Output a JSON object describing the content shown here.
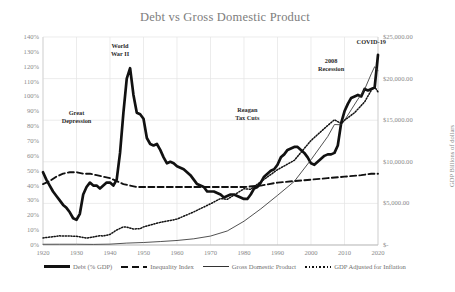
{
  "chart_data": {
    "type": "line",
    "title": "Debt vs Gross Domestic Product",
    "xlabel": "",
    "ylabel_left": "",
    "ylabel_right": "GDP Billions of dollars",
    "grid": true,
    "legend_position": "bottom",
    "xlim": [
      1920,
      2020
    ],
    "xticks": [
      "1920",
      "1930",
      "1940",
      "1950",
      "1960",
      "1970",
      "1980",
      "1990",
      "2000",
      "2010",
      "2020"
    ],
    "ylim_left": [
      0,
      140
    ],
    "yticks_left": [
      "0%",
      "10%",
      "20%",
      "30%",
      "40%",
      "50%",
      "60%",
      "70%",
      "80%",
      "90%",
      "100%",
      "110%",
      "120%",
      "130%",
      "140%"
    ],
    "ylim_right": [
      0,
      25000
    ],
    "yticks_right": [
      "$-",
      "$5,000.00",
      "$10,000.00",
      "$15,000.00",
      "$20,000.00",
      "$25,000.00"
    ],
    "annotations": [
      {
        "text": "Great Depression",
        "lines": [
          "Great",
          "Depression"
        ],
        "x": 1930,
        "y": 88
      },
      {
        "text": "World War II",
        "lines": [
          "World",
          "War II"
        ],
        "x": 1943,
        "y": 133
      },
      {
        "text": "Reagan Tax Cuts",
        "lines": [
          "Reagan",
          "Tax Cuts"
        ],
        "x": 1981,
        "y": 90
      },
      {
        "text": "2008 Recession",
        "lines": [
          "2008",
          "Recession"
        ],
        "x": 2006,
        "y": 123
      },
      {
        "text": "COVID-19",
        "lines": [
          "COVID-19"
        ],
        "x": 2018,
        "y": 136
      }
    ],
    "series": [
      {
        "name": "Debt (% GDP)",
        "axis": "left",
        "style": "solid-thick",
        "color": "#111111",
        "x": [
          1920,
          1921,
          1922,
          1923,
          1924,
          1925,
          1926,
          1927,
          1928,
          1929,
          1930,
          1931,
          1932,
          1933,
          1934,
          1935,
          1936,
          1937,
          1938,
          1939,
          1940,
          1941,
          1942,
          1943,
          1944,
          1945,
          1946,
          1947,
          1948,
          1949,
          1950,
          1951,
          1952,
          1953,
          1954,
          1955,
          1956,
          1957,
          1958,
          1959,
          1960,
          1961,
          1962,
          1963,
          1964,
          1965,
          1966,
          1967,
          1968,
          1969,
          1970,
          1971,
          1972,
          1973,
          1974,
          1975,
          1976,
          1977,
          1978,
          1979,
          1980,
          1981,
          1982,
          1983,
          1984,
          1985,
          1986,
          1987,
          1988,
          1989,
          1990,
          1991,
          1992,
          1993,
          1994,
          1995,
          1996,
          1997,
          1998,
          1999,
          2000,
          2001,
          2002,
          2003,
          2004,
          2005,
          2006,
          2007,
          2008,
          2009,
          2010,
          2011,
          2012,
          2013,
          2014,
          2015,
          2016,
          2017,
          2018,
          2019,
          2020
        ],
        "values": [
          49,
          44,
          40,
          36,
          33,
          30,
          27,
          25,
          22,
          18,
          17,
          21,
          34,
          39,
          42,
          40,
          40,
          38,
          40,
          42,
          42,
          40,
          44,
          62,
          89,
          112,
          119,
          101,
          89,
          88,
          85,
          72,
          68,
          67,
          68,
          64,
          59,
          55,
          56,
          55,
          53,
          52,
          51,
          49,
          47,
          44,
          41,
          40,
          39,
          36,
          36,
          36,
          35,
          34,
          32,
          33,
          34,
          34,
          33,
          32,
          31,
          31,
          34,
          38,
          39,
          42,
          46,
          48,
          50,
          51,
          54,
          59,
          61,
          64,
          65,
          66,
          66,
          64,
          62,
          59,
          55,
          54,
          56,
          58,
          60,
          61,
          61,
          62,
          67,
          82,
          90,
          95,
          99,
          100,
          101,
          100,
          105,
          104,
          105,
          106,
          128
        ]
      },
      {
        "name": "Inequality Index",
        "axis": "left",
        "style": "dashed",
        "color": "#111111",
        "x": [
          1920,
          1922,
          1924,
          1926,
          1928,
          1930,
          1932,
          1934,
          1936,
          1938,
          1940,
          1942,
          1944,
          1946,
          1948,
          1950,
          1955,
          1960,
          1965,
          1970,
          1975,
          1980,
          1985,
          1990,
          1995,
          2000,
          2005,
          2010,
          2015,
          2018,
          2020
        ],
        "values": [
          41,
          43,
          46,
          48,
          49,
          49,
          48,
          48,
          47,
          46,
          45,
          43,
          41,
          40,
          39,
          39,
          39,
          39,
          39,
          39,
          39,
          39,
          40,
          42,
          43,
          44,
          45,
          46,
          47,
          48,
          48
        ]
      },
      {
        "name": "Gross Domestic Product",
        "axis": "right",
        "style": "solid-thin",
        "color": "#333333",
        "x": [
          1920,
          1925,
          1930,
          1935,
          1940,
          1945,
          1950,
          1955,
          1960,
          1965,
          1970,
          1975,
          1980,
          1985,
          1990,
          1995,
          2000,
          2005,
          2007,
          2009,
          2010,
          2012,
          2014,
          2016,
          2018,
          2019,
          2020
        ],
        "values": [
          88,
          94,
          92,
          74,
          103,
          228,
          300,
          415,
          543,
          744,
          1073,
          1685,
          2857,
          4339,
          5963,
          7640,
          10250,
          13040,
          14480,
          14450,
          14990,
          16250,
          17520,
          18700,
          20580,
          21430,
          20940
        ]
      },
      {
        "name": "GDP Adjusted for Inflation",
        "axis": "right",
        "style": "dotted",
        "color": "#111111",
        "x": [
          1920,
          1925,
          1930,
          1933,
          1935,
          1937,
          1938,
          1940,
          1942,
          1944,
          1945,
          1947,
          1949,
          1950,
          1955,
          1960,
          1965,
          1970,
          1973,
          1975,
          1980,
          1982,
          1985,
          1990,
          1995,
          2000,
          2005,
          2007,
          2009,
          2010,
          2013,
          2016,
          2018,
          2019,
          2020
        ],
        "values": [
          850,
          1100,
          1050,
          830,
          960,
          1130,
          1080,
          1270,
          1800,
          2180,
          2150,
          1930,
          1950,
          2180,
          2720,
          3110,
          3980,
          4950,
          5580,
          5490,
          6760,
          6700,
          7600,
          9050,
          10170,
          12560,
          14370,
          15050,
          14600,
          14990,
          15900,
          17200,
          18600,
          19000,
          18400
        ]
      }
    ]
  },
  "legend": {
    "items": [
      {
        "label": "Debt (% GDP)",
        "icon": "solid-thick-line-icon"
      },
      {
        "label": "Inequality Index",
        "icon": "dashed-line-icon"
      },
      {
        "label": "Gross Domestic Product",
        "icon": "solid-thin-line-icon"
      },
      {
        "label": "GDP Adjusted for Inflation",
        "icon": "dotted-line-icon"
      }
    ]
  }
}
